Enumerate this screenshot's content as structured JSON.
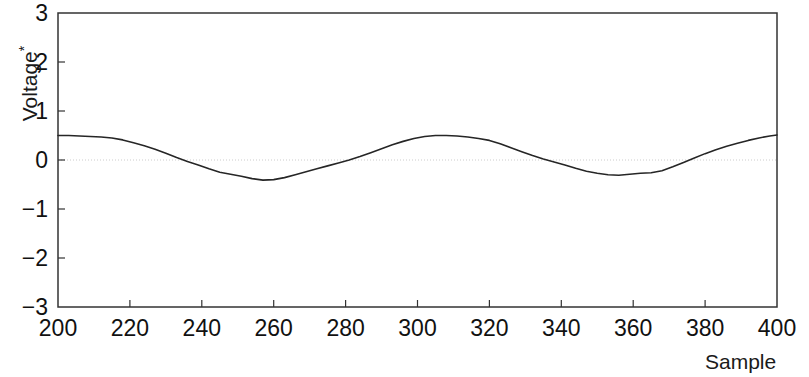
{
  "chart_data": {
    "type": "line",
    "title": "",
    "xlabel": "Sample",
    "ylabel": "Voltage",
    "ylabel_superscript": "*",
    "xlim": [
      200,
      400
    ],
    "ylim": [
      -3,
      3
    ],
    "xticks": [
      200,
      220,
      240,
      260,
      280,
      300,
      320,
      340,
      360,
      380,
      400
    ],
    "yticks": [
      3,
      2,
      1,
      0,
      -1,
      -2,
      -3
    ],
    "xtick_labels": [
      "200",
      "220",
      "240",
      "260",
      "280",
      "300",
      "320",
      "340",
      "360",
      "380",
      "400"
    ],
    "ytick_labels": [
      "3",
      "2",
      "1",
      "0",
      "−1",
      "−2",
      "−3"
    ],
    "grid": false,
    "zero_line": true,
    "zero_line_color": "#cccccc",
    "legend": "none",
    "line_color": "#262626",
    "line_width": 1.6,
    "background_color": "#ffffff",
    "axis_color": "#333333",
    "series": [
      {
        "name": "Voltage",
        "x": [
          200,
          203,
          206,
          209,
          212,
          215,
          218,
          221,
          224,
          227,
          230,
          233,
          236,
          239,
          242,
          245,
          248,
          251,
          254,
          257,
          260,
          263,
          266,
          269,
          272,
          275,
          278,
          281,
          284,
          287,
          290,
          293,
          296,
          299,
          302,
          305,
          308,
          311,
          314,
          317,
          320,
          323,
          326,
          329,
          332,
          335,
          338,
          341,
          344,
          347,
          350,
          353,
          356,
          359,
          362,
          365,
          368,
          371,
          374,
          377,
          380,
          383,
          386,
          389,
          392,
          395,
          398,
          400
        ],
        "y": [
          0.5,
          0.5,
          0.49,
          0.48,
          0.47,
          0.45,
          0.41,
          0.35,
          0.29,
          0.22,
          0.14,
          0.05,
          -0.03,
          -0.1,
          -0.18,
          -0.25,
          -0.29,
          -0.33,
          -0.38,
          -0.41,
          -0.4,
          -0.36,
          -0.3,
          -0.24,
          -0.18,
          -0.12,
          -0.06,
          0.0,
          0.07,
          0.15,
          0.23,
          0.31,
          0.38,
          0.44,
          0.48,
          0.5,
          0.5,
          0.49,
          0.47,
          0.44,
          0.4,
          0.33,
          0.25,
          0.17,
          0.09,
          0.02,
          -0.04,
          -0.1,
          -0.17,
          -0.23,
          -0.27,
          -0.3,
          -0.31,
          -0.29,
          -0.27,
          -0.26,
          -0.22,
          -0.14,
          -0.05,
          0.04,
          0.13,
          0.21,
          0.28,
          0.34,
          0.4,
          0.45,
          0.49,
          0.51
        ]
      }
    ]
  }
}
